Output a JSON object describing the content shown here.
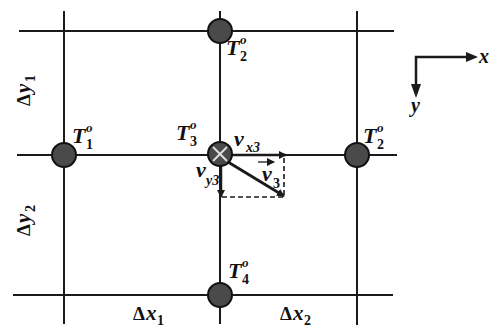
{
  "diagram": {
    "colors": {
      "line": "#1a1a1a",
      "node_fill": "#4a4a4a",
      "node_stroke": "#111111",
      "background": "#ffffff"
    },
    "nodes": [
      {
        "id": "T1",
        "label": "T",
        "sup": "o",
        "sub": "1",
        "position": "left"
      },
      {
        "id": "T2_top",
        "label": "T",
        "sup": "o",
        "sub": "2",
        "position": "top"
      },
      {
        "id": "T2_right",
        "label": "T",
        "sup": "o",
        "sub": "2",
        "position": "right"
      },
      {
        "id": "T3",
        "label": "T",
        "sup": "o",
        "sub": "3",
        "position": "center",
        "marker": "cross"
      },
      {
        "id": "T4",
        "label": "T",
        "sup": "o",
        "sub": "4",
        "position": "bottom"
      }
    ],
    "velocity": {
      "vx": {
        "label": "v",
        "sub": "x3"
      },
      "vy": {
        "label": "v",
        "sub": "y3"
      },
      "v": {
        "label": "v",
        "sub": "3",
        "vector_mark": "→"
      }
    },
    "spacings": {
      "dx1": {
        "delta": "Δ",
        "var": "x",
        "sub": "1"
      },
      "dx2": {
        "delta": "Δ",
        "var": "x",
        "sub": "2"
      },
      "dy1": {
        "delta": "Δ",
        "var": "y",
        "sub": "1"
      },
      "dy2": {
        "delta": "Δ",
        "var": "y",
        "sub": "2"
      }
    },
    "axes": {
      "x_label": "x",
      "y_label": "y"
    }
  }
}
